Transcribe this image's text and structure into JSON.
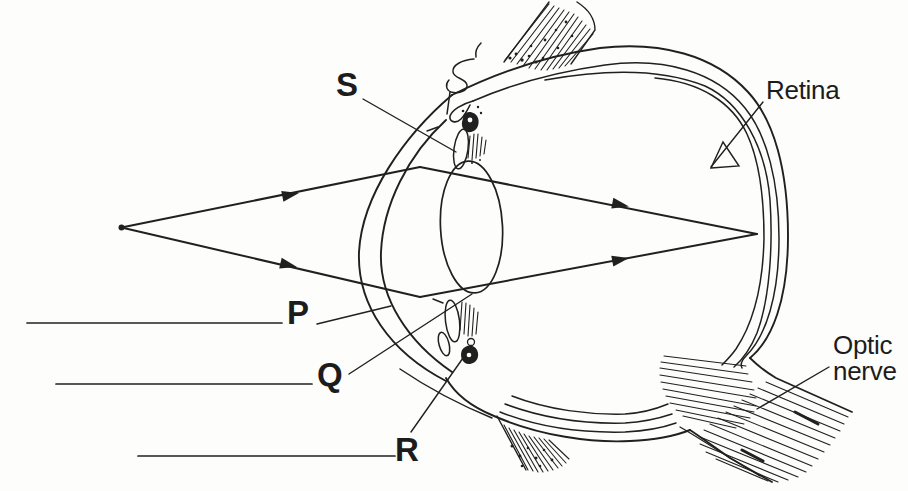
{
  "diagram": {
    "labels": {
      "s": "S",
      "p": "P",
      "q": "Q",
      "r": "R",
      "retina": "Retina",
      "optic_line1": "Optic",
      "optic_line2": "nerve"
    },
    "answer_lines": [
      {
        "value": ""
      },
      {
        "value": ""
      },
      {
        "value": ""
      }
    ],
    "colors": {
      "ink": "#202020",
      "paper": "#fdfdfb"
    }
  }
}
